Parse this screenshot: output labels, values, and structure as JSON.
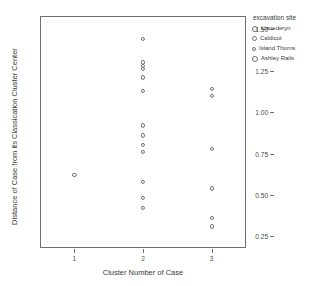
{
  "top_clipped_text": "· · · · · · · · · · · · · · · ·",
  "legend": {
    "title": "excavation site",
    "items": [
      {
        "label": "Llanederyn",
        "marker": "open-circle",
        "size": 6
      },
      {
        "label": "Caldicot",
        "marker": "open-circle",
        "size": 5
      },
      {
        "label": "Island Thorns",
        "marker": "open-circle",
        "size": 4
      },
      {
        "label": "Ashley Rails",
        "marker": "open-circle",
        "size": 6
      }
    ]
  },
  "chart_data": {
    "type": "scatter",
    "title": "",
    "xlabel": "Cluster Number of Case",
    "ylabel": "Distance of Case from its Classication Cluster Center",
    "xlim": [
      0.5,
      3.5
    ],
    "ylim": [
      0.18,
      1.58
    ],
    "xticks": [
      1,
      2,
      3
    ],
    "xticklabels": [
      "1",
      "2",
      "3"
    ],
    "yticks": [
      0.25,
      0.5,
      0.75,
      1.0,
      1.25,
      1.5
    ],
    "yticklabels": [
      "0.25",
      "0.50",
      "0.75",
      "1.00",
      "1.25",
      "1.50"
    ],
    "grid": false,
    "legend_position": "right",
    "marker": "open-circle",
    "points": [
      {
        "x": 1,
        "y": 0.62
      },
      {
        "x": 2,
        "y": 1.44
      },
      {
        "x": 2,
        "y": 1.3
      },
      {
        "x": 2,
        "y": 1.28
      },
      {
        "x": 2,
        "y": 1.26
      },
      {
        "x": 2,
        "y": 1.21
      },
      {
        "x": 2,
        "y": 1.13
      },
      {
        "x": 2,
        "y": 0.92
      },
      {
        "x": 2,
        "y": 0.86
      },
      {
        "x": 2,
        "y": 0.8
      },
      {
        "x": 2,
        "y": 0.76
      },
      {
        "x": 2,
        "y": 0.58
      },
      {
        "x": 2,
        "y": 0.48
      },
      {
        "x": 2,
        "y": 0.42
      },
      {
        "x": 3,
        "y": 1.14
      },
      {
        "x": 3,
        "y": 1.1
      },
      {
        "x": 3,
        "y": 0.78
      },
      {
        "x": 3,
        "y": 0.54
      },
      {
        "x": 3,
        "y": 0.36
      },
      {
        "x": 3,
        "y": 0.31
      }
    ]
  }
}
